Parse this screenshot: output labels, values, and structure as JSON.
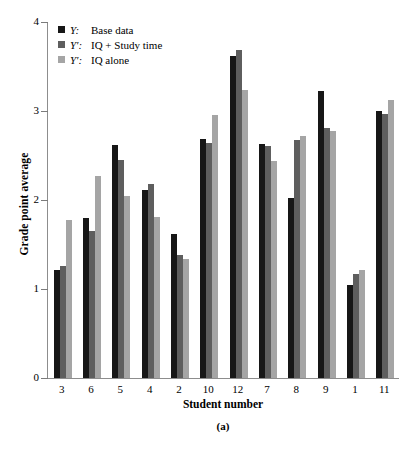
{
  "chart_data": {
    "type": "bar",
    "title": "",
    "caption": "(a)",
    "xlabel": "Student number",
    "ylabel": "Grade point average",
    "categories": [
      "3",
      "6",
      "5",
      "4",
      "2",
      "10",
      "12",
      "7",
      "8",
      "9",
      "1",
      "11"
    ],
    "series": [
      {
        "name": "Y:  Base data",
        "symbol": "Y:",
        "label": "Base data",
        "color": "#171717",
        "values": [
          1.21,
          1.8,
          2.62,
          2.11,
          1.62,
          2.68,
          3.62,
          2.63,
          2.02,
          3.23,
          1.04,
          3.0
        ]
      },
      {
        "name": "Y′:  IQ + Study time",
        "symbol": "Y′:",
        "label": "IQ + Study time",
        "color": "#5e5e5e",
        "values": [
          1.26,
          1.65,
          2.45,
          2.18,
          1.38,
          2.64,
          3.69,
          2.61,
          2.67,
          2.81,
          1.17,
          2.97
        ]
      },
      {
        "name": "Y′:  IQ alone",
        "symbol": "Y′:",
        "label": "IQ alone",
        "color": "#a5a5a5",
        "values": [
          1.77,
          2.27,
          2.05,
          1.81,
          1.34,
          2.96,
          3.24,
          2.44,
          2.72,
          2.78,
          1.21,
          3.12
        ]
      }
    ],
    "ylim": [
      0,
      4
    ],
    "yticks": [
      0,
      1,
      2,
      3,
      4
    ],
    "ytick_labels": [
      "0",
      "1",
      "2",
      "3",
      "4"
    ],
    "grid": false,
    "legend_position": "top-left",
    "axis_color": "#8d8d8d"
  }
}
